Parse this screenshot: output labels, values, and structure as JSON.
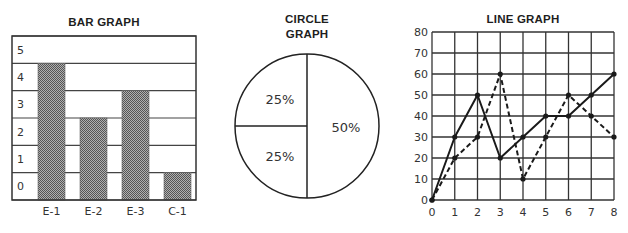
{
  "chart_data": [
    {
      "type": "bar",
      "title": "BAR GRAPH",
      "categories": [
        "E-1",
        "E-2",
        "E-3",
        "C-1"
      ],
      "values": [
        4,
        2,
        3,
        0
      ],
      "y_ticks": [
        "5",
        "4",
        "3",
        "2",
        "1",
        "0"
      ],
      "xlabel": "",
      "ylabel": "",
      "ylim": [
        0,
        5
      ],
      "grid": true,
      "bar_fill": "checkered dark gray",
      "legend": null
    },
    {
      "type": "pie",
      "title": "CIRCLE GRAPH",
      "title_lines": [
        "CIRCLE",
        "GRAPH"
      ],
      "slices": [
        {
          "label": "25%",
          "value": 25,
          "position": "upper-left"
        },
        {
          "label": "25%",
          "value": 25,
          "position": "lower-left"
        },
        {
          "label": "50%",
          "value": 50,
          "position": "right"
        }
      ],
      "legend": null
    },
    {
      "type": "line",
      "title": "LINE GRAPH",
      "x": [
        0,
        1,
        2,
        3,
        4,
        5,
        6,
        7,
        8
      ],
      "x_ticks": [
        "0",
        "1",
        "2",
        "3",
        "4",
        "5",
        "6",
        "7",
        "8"
      ],
      "y_ticks": [
        "0",
        "10",
        "20",
        "30",
        "40",
        "50",
        "60",
        "70",
        "80"
      ],
      "xlim": [
        0,
        8
      ],
      "ylim": [
        0,
        80
      ],
      "grid": true,
      "series": [
        {
          "name": "solid",
          "style": "solid",
          "values": [
            0,
            30,
            50,
            20,
            30,
            40,
            40,
            50,
            60
          ]
        },
        {
          "name": "dashed",
          "style": "dashed",
          "values": [
            0,
            20,
            30,
            60,
            10,
            30,
            50,
            40,
            30
          ]
        }
      ],
      "xlabel": "",
      "ylabel": "",
      "legend": null
    }
  ],
  "colors": {
    "ink": "#222222",
    "grid": "#333333",
    "bar_dark": "#555555",
    "bar_light": "#b0b0b0"
  }
}
